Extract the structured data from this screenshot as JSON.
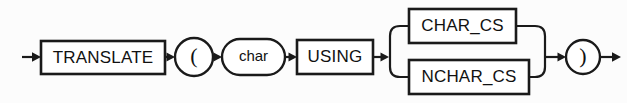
{
  "diagram": {
    "name": "TRANSLATE ... USING syntax diagram",
    "type": "railroad-syntax-diagram",
    "background_color": "#fcfcfc",
    "line_color": "#1a1a1a",
    "text_color": "#111111",
    "main_line_y": 57,
    "entry_arrow": {
      "label": "entry-arrow",
      "x_start": 22,
      "x_end": 41
    },
    "exit_arrow": {
      "label": "exit-arrow",
      "x_start": 600,
      "x_end": 621
    },
    "nodes": [
      {
        "id": "translate",
        "kind": "keyword-box",
        "label": "TRANSLATE",
        "x": 41,
        "y": 41,
        "width": 124,
        "height": 33
      },
      {
        "id": "open-paren",
        "kind": "circle",
        "label": "(",
        "cx": 194,
        "cy": 57,
        "rx": 19,
        "ry": 19
      },
      {
        "id": "char",
        "kind": "oval",
        "label": "char",
        "x": 222,
        "y": 39,
        "width": 63,
        "height": 36
      },
      {
        "id": "using",
        "kind": "keyword-box",
        "label": "USING",
        "x": 297,
        "y": 40,
        "width": 76,
        "height": 34
      },
      {
        "id": "char-cs",
        "kind": "keyword-box",
        "label": "CHAR_CS",
        "x": 409,
        "y": 9,
        "width": 107,
        "height": 34,
        "branch": "upper"
      },
      {
        "id": "nchar-cs",
        "kind": "keyword-box",
        "label": "NCHAR_CS",
        "x": 409,
        "y": 60,
        "width": 120,
        "height": 34,
        "branch": "lower"
      },
      {
        "id": "close-paren",
        "kind": "circle",
        "label": ")",
        "cx": 583,
        "cy": 57,
        "rx": 17,
        "ry": 17
      }
    ],
    "choice_group": {
      "label": "character-set-choice",
      "split_x": 390,
      "join_x": 545,
      "upper_y": 26,
      "lower_y": 77,
      "options": [
        "CHAR_CS",
        "NCHAR_CS"
      ]
    },
    "sequence_text": "TRANSLATE ( char USING CHAR_CS | NCHAR_CS )"
  }
}
